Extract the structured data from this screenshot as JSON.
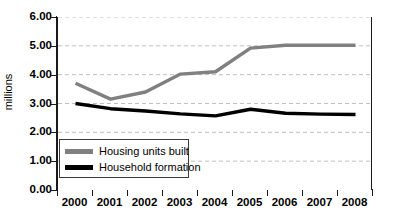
{
  "chart_data": {
    "type": "line",
    "title": "",
    "xlabel": "",
    "ylabel": "millions",
    "categories": [
      "2000",
      "2001",
      "2002",
      "2003",
      "2004",
      "2005",
      "2006",
      "2007",
      "2008"
    ],
    "ylim": [
      0.0,
      6.0
    ],
    "ytick_labels": [
      "6.00",
      "5.00",
      "4.00",
      "3.00",
      "2.00",
      "1.00",
      "0.00"
    ],
    "ytick_values": [
      6.0,
      5.0,
      4.0,
      3.0,
      2.0,
      1.0,
      0.0
    ],
    "grid": "horizontal-dashed",
    "legend_position": "inside-bottom-left",
    "series": [
      {
        "name": "Housing units built",
        "color": "#808080",
        "values": [
          3.7,
          3.15,
          3.4,
          4.02,
          4.1,
          4.92,
          5.02,
          5.02,
          5.02
        ]
      },
      {
        "name": "Household formation",
        "color": "#000000",
        "values": [
          3.0,
          2.82,
          2.74,
          2.64,
          2.57,
          2.8,
          2.66,
          2.63,
          2.62
        ]
      }
    ]
  },
  "legend": {
    "items": [
      {
        "label": "Housing units built",
        "color": "#808080"
      },
      {
        "label": "Household formation",
        "color": "#000000"
      }
    ]
  },
  "colors": {
    "series_gray": "#808080",
    "series_black": "#000000",
    "gridline": "#bfbfbf",
    "axis": "#1a1a1a",
    "background": "#ffffff"
  }
}
